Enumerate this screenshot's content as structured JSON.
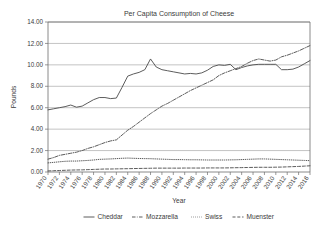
{
  "chart_data": {
    "type": "line",
    "title": "Per Capita Consumption of Cheese",
    "xlabel": "Year",
    "ylabel": "Pounds",
    "ylim": [
      0,
      14
    ],
    "ytick_labels": [
      "0.00",
      "2.00",
      "4.00",
      "6.00",
      "8.00",
      "10.00",
      "12.00",
      "14.00"
    ],
    "ytick_values": [
      0,
      2,
      4,
      6,
      8,
      10,
      12,
      14
    ],
    "grid": true,
    "legend_position": "bottom",
    "xlim": [
      1970,
      2016
    ],
    "xtick_labels": [
      "1970",
      "1972",
      "1974",
      "1976",
      "1978",
      "1980",
      "1982",
      "1984",
      "1986",
      "1988",
      "1990",
      "1992",
      "1994",
      "1996",
      "1998",
      "2000",
      "2002",
      "2004",
      "2006",
      "2008",
      "2010",
      "2012",
      "2014",
      "2016"
    ],
    "x": [
      1970,
      1971,
      1972,
      1973,
      1974,
      1975,
      1976,
      1977,
      1978,
      1979,
      1980,
      1981,
      1982,
      1983,
      1984,
      1985,
      1986,
      1987,
      1988,
      1989,
      1990,
      1991,
      1992,
      1993,
      1994,
      1995,
      1996,
      1997,
      1998,
      1999,
      2000,
      2001,
      2002,
      2003,
      2004,
      2005,
      2006,
      2007,
      2008,
      2009,
      2010,
      2011,
      2012,
      2013,
      2014,
      2015,
      2016
    ],
    "series": [
      {
        "name": "Cheddar",
        "style": "solid",
        "color": "#4a4a4a",
        "values": [
          5.8,
          5.9,
          6.0,
          6.1,
          6.25,
          6.05,
          6.15,
          6.45,
          6.75,
          6.95,
          6.95,
          6.85,
          6.9,
          7.9,
          8.95,
          9.15,
          9.3,
          9.55,
          10.55,
          9.8,
          9.55,
          9.45,
          9.35,
          9.25,
          9.15,
          9.2,
          9.15,
          9.25,
          9.5,
          9.85,
          10.0,
          9.95,
          10.05,
          9.55,
          9.75,
          9.9,
          10.0,
          10.05,
          10.05,
          10.05,
          10.05,
          9.55,
          9.55,
          9.6,
          9.8,
          10.1,
          10.4
        ]
      },
      {
        "name": "Mozzarella",
        "style": "dash-dot",
        "color": "#4a4a4a",
        "values": [
          1.2,
          1.35,
          1.55,
          1.65,
          1.75,
          1.85,
          2.0,
          2.2,
          2.35,
          2.55,
          2.75,
          2.9,
          3.0,
          3.45,
          3.9,
          4.25,
          4.65,
          5.05,
          5.45,
          5.8,
          6.15,
          6.4,
          6.7,
          7.0,
          7.3,
          7.6,
          7.85,
          8.1,
          8.35,
          8.6,
          9.0,
          9.25,
          9.45,
          9.65,
          9.85,
          10.15,
          10.4,
          10.55,
          10.45,
          10.35,
          10.45,
          10.75,
          10.9,
          11.1,
          11.3,
          11.55,
          11.8
        ]
      },
      {
        "name": "Swiss",
        "style": "dotted",
        "color": "#4a4a4a",
        "values": [
          0.85,
          0.9,
          0.95,
          1.0,
          1.02,
          1.02,
          1.05,
          1.08,
          1.12,
          1.18,
          1.2,
          1.22,
          1.25,
          1.28,
          1.3,
          1.28,
          1.26,
          1.25,
          1.24,
          1.22,
          1.2,
          1.18,
          1.16,
          1.16,
          1.15,
          1.14,
          1.14,
          1.13,
          1.12,
          1.12,
          1.12,
          1.12,
          1.13,
          1.14,
          1.16,
          1.18,
          1.2,
          1.22,
          1.22,
          1.2,
          1.18,
          1.16,
          1.14,
          1.12,
          1.1,
          1.08,
          1.06
        ]
      },
      {
        "name": "Muenster",
        "style": "dashed",
        "color": "#4a4a4a",
        "values": [
          0.1,
          0.12,
          0.14,
          0.16,
          0.18,
          0.19,
          0.2,
          0.22,
          0.24,
          0.26,
          0.28,
          0.28,
          0.29,
          0.3,
          0.31,
          0.32,
          0.33,
          0.34,
          0.35,
          0.36,
          0.36,
          0.36,
          0.36,
          0.36,
          0.37,
          0.37,
          0.37,
          0.37,
          0.38,
          0.38,
          0.38,
          0.38,
          0.39,
          0.4,
          0.41,
          0.42,
          0.43,
          0.44,
          0.44,
          0.44,
          0.45,
          0.46,
          0.48,
          0.5,
          0.52,
          0.55,
          0.58
        ]
      }
    ]
  }
}
